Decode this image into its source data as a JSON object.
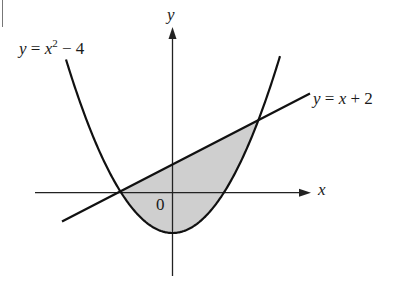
{
  "figure": {
    "labels": {
      "parabola": {
        "lhs": "y",
        "eq": " = ",
        "var": "x",
        "exp": "2",
        "rest": " − 4"
      },
      "line": {
        "lhs": "y",
        "eq": " = ",
        "var": "x",
        "rest": " + 2"
      },
      "x_axis": "x",
      "y_axis": "y",
      "origin": "0"
    },
    "colors": {
      "stroke": "#111111",
      "axis": "#222222",
      "fill": "#cfcfcf"
    },
    "geometry_px": {
      "origin": [
        172.5,
        192.7
      ],
      "x_axis": {
        "from": 35,
        "to": 311
      },
      "y_axis": {
        "from": 276,
        "to": 27
      },
      "parabola": {
        "vertex": [
          172.5,
          233
        ],
        "a": 0.0153,
        "x_range": [
          66,
          280
        ]
      },
      "line": {
        "from": [
          62,
          221.5
        ],
        "to": [
          310,
          93.5
        ]
      },
      "intersections": [
        [
          120.7,
          192.7
        ],
        [
          257,
          122
        ]
      ]
    }
  }
}
